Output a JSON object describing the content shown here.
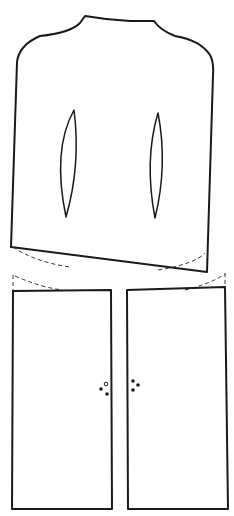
{
  "diagram": {
    "type": "sewing-pattern",
    "colors": {
      "line": "#1a1a1a",
      "background": "#ffffff"
    },
    "pieces": [
      {
        "id": "bodice-back",
        "darts": 2,
        "has_dashed_hem_guide": true
      },
      {
        "id": "left-front-panel",
        "buttons": 3
      },
      {
        "id": "right-front-panel",
        "buttons": 3
      }
    ]
  }
}
